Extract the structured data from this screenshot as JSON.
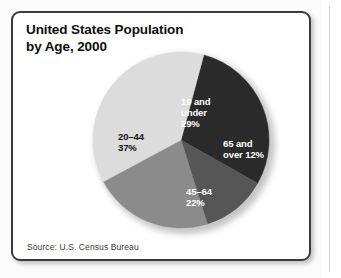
{
  "figure": {
    "title_line1": "United States Population",
    "title_line2": "by Age, 2000",
    "source": "Source: U.S. Census Bureau"
  },
  "chart_data": {
    "type": "pie",
    "title": "United States Population by Age, 2000",
    "subtitle": "",
    "xlabel": "",
    "ylabel": "",
    "source": "Source: U.S. Census Bureau",
    "units": "percent of total population",
    "legend_position": "none",
    "labels_inside_slices": true,
    "start_angle_deg": -75,
    "direction": "clockwise",
    "categories": [
      "19 and under",
      "65 and over",
      "45-64",
      "20-44"
    ],
    "values": [
      29,
      12,
      22,
      37
    ],
    "colors": [
      "#2a2a2a",
      "#565656",
      "#8b8b8b",
      "#dcdcdc"
    ],
    "slices": [
      {
        "name": "19 and under",
        "value": 29,
        "color": "#2a2a2a",
        "label_line1": "19 and",
        "label_line2": "under",
        "label_line3": "29%",
        "label_color": "#ffffff"
      },
      {
        "name": "65 and over",
        "value": 12,
        "color": "#565656",
        "label_line1": "65 and",
        "label_line2": "over 12%",
        "label_line3": "",
        "label_color": "#ffffff"
      },
      {
        "name": "45-64",
        "value": 22,
        "color": "#8b8b8b",
        "label_line1": "45–64",
        "label_line2": "22%",
        "label_line3": "",
        "label_color": "#ffffff"
      },
      {
        "name": "20-44",
        "value": 37,
        "color": "#dcdcdc",
        "label_line1": "20–44",
        "label_line2": "37%",
        "label_line3": "",
        "label_color": "#111111"
      }
    ]
  }
}
